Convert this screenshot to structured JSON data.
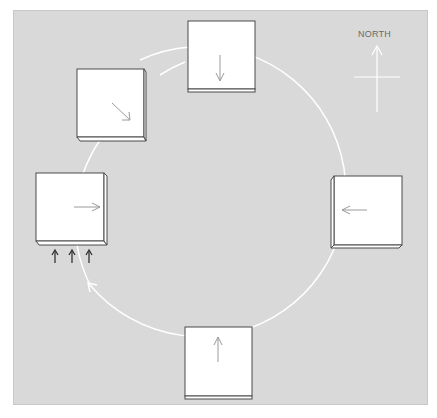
{
  "diagram": {
    "compass_label": "NORTH",
    "colors": {
      "background": "#d9d9d9",
      "circle": "#ffffff",
      "panel": "#ffffff",
      "panel_border": "#4a4a4a",
      "panel_arrow": "#9a9a9a",
      "incoming_arrows": "#333333"
    },
    "circle": {
      "cx": 219,
      "cy": 210,
      "r": 145,
      "direction": "counter-clockwise arrowhead at lower-left"
    },
    "panels": [
      {
        "id": "top",
        "x": 188,
        "y": 21,
        "w": 67,
        "h": 70,
        "arrow": "down"
      },
      {
        "id": "upper-left",
        "x": 77,
        "y": 69,
        "w": 67,
        "h": 72,
        "arrow": "down-right"
      },
      {
        "id": "left",
        "x": 36,
        "y": 173,
        "w": 69,
        "h": 70,
        "arrow": "right",
        "incoming_arrows": 3
      },
      {
        "id": "right",
        "x": 331,
        "y": 176,
        "w": 71,
        "h": 71,
        "arrow": "left"
      },
      {
        "id": "bottom",
        "x": 185,
        "y": 327,
        "w": 67,
        "h": 72,
        "arrow": "up"
      }
    ]
  }
}
